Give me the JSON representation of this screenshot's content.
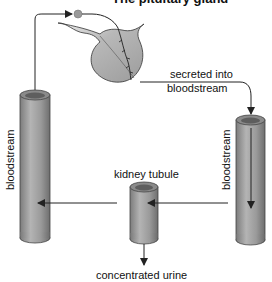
{
  "title": "The pituitary gland",
  "labels": {
    "secreted_line1": "secreted into",
    "secreted_line2": "bloodstream",
    "left_vessel": "bloodstream",
    "right_vessel": "bloodstream",
    "kidney_tubule": "kidney tubule",
    "output": "concentrated urine"
  },
  "colors": {
    "tube_fill": "#9a9a9a",
    "tube_light": "#c4c4c4",
    "gland_fill": "#a8a8a8",
    "line": "#222222",
    "background": "#ffffff"
  },
  "icons": {
    "hormone_dot": "circle",
    "arrows": "arrowheads"
  }
}
